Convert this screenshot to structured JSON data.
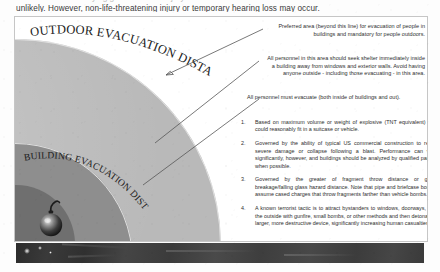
{
  "page": {
    "body_text": {
      "line_cut_off": "and the hazards of flying glass. Serious injury from the blast itself is",
      "line_visible": "unlikely. However, non-life-threatening injury or temporary hearing loss may occur."
    }
  },
  "figure": {
    "zone_labels": [
      {
        "id": "outdoor-evacuation-distance",
        "text": "OUTDOOR EVACUATION DISTANCE"
      },
      {
        "id": "building-evacuation-distance",
        "text": "BUILDING EVACUATION DISTANCE"
      }
    ],
    "callouts": [
      {
        "id": "preferred-area",
        "lines": [
          "Preferred area (beyond this line) for evacuation of people in",
          "buildings and mandatory for people outdoors."
        ]
      },
      {
        "id": "seek-shelter",
        "lines": [
          "All personnel in this area should seek shelter immediately inside",
          "a building away from windows and exterior walls.  Avoid having",
          "anyone outside - including those evacuating - in this area."
        ]
      },
      {
        "id": "must-evacuate",
        "lines": [
          "All personnel must evacuate (both inside of buildings and out)."
        ]
      }
    ],
    "notes": [
      {
        "number": "1.",
        "text": "Based on maximum volume or weight of explosive (TNT equivalent) that could reasonably fit in a suitcase or vehicle."
      },
      {
        "number": "2.",
        "text": "Governed by the ability of typical US commercial construction to resist severe damage or collapse following a blast.  Performance can vary significantly, however, and buildings should be analyzed by qualified parties when possible."
      },
      {
        "number": "3.",
        "text": "Governed by the greater of fragment throw distance or glass breakage/falling glass hazard distance.  Note that pipe and briefcase bombs assume cased charges that throw fragments farther than vehicle bombs."
      },
      {
        "number": "4.",
        "text": "A known terrorist tactic is to attract bystanders to windows, doorways, and the outside with gunfire, small bombs, or other methods and then detonate a larger, more destructive device, significantly increasing human casualties."
      }
    ],
    "icons": {
      "bomb": "bomb-icon"
    },
    "colors": {
      "outdoor_zone": "#b9b9b9",
      "building_zone": "#8e8e8e",
      "core_zone": "#6f6f6f",
      "leader_line": "#575757",
      "page_background": "#fdfdfd",
      "photo_strip": "#3a3a3a"
    }
  }
}
